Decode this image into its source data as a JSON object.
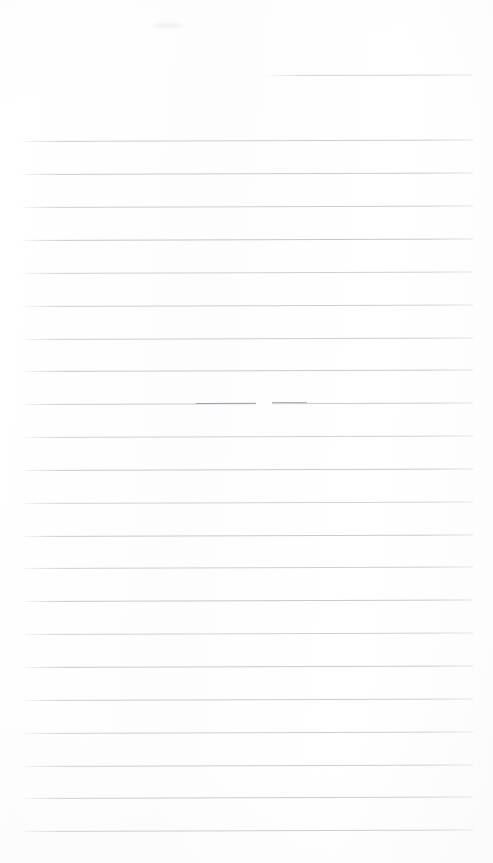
{
  "page": {
    "width": 493,
    "height": 863,
    "background_color": "#fefefe",
    "paper_tone": "#fdfdfe",
    "content_text": "",
    "is_blank": "true"
  },
  "ruling": {
    "line_color": "#c9cacf",
    "line_color_dark": "#9b9ca3",
    "line_count": 22,
    "spacing_px": 33,
    "margin_left_px": 19,
    "margin_right_px": 473,
    "stroke_width_px": 1,
    "skew_degrees": -0.18
  },
  "lines": [
    {
      "name": "rule-01",
      "y": 75,
      "x1": 263,
      "x2": 472,
      "color": "#cdced3",
      "opacity": 0.85,
      "skew": -0.16
    },
    {
      "name": "rule-02",
      "y": 141,
      "x1": 19,
      "x2": 473,
      "color": "#c9cacf",
      "opacity": 0.9,
      "skew": -0.18
    },
    {
      "name": "rule-03",
      "y": 174,
      "x1": 19,
      "x2": 473,
      "color": "#c7c8ce",
      "opacity": 0.92,
      "skew": -0.18
    },
    {
      "name": "rule-04",
      "y": 207,
      "x1": 19,
      "x2": 473,
      "color": "#c9cacf",
      "opacity": 0.9,
      "skew": -0.18
    },
    {
      "name": "rule-05",
      "y": 240,
      "x1": 19,
      "x2": 473,
      "color": "#c4c5cb",
      "opacity": 0.94,
      "skew": -0.19
    },
    {
      "name": "rule-06",
      "y": 273,
      "x1": 19,
      "x2": 473,
      "color": "#cbccd1",
      "opacity": 0.88,
      "skew": -0.18
    },
    {
      "name": "rule-07",
      "y": 306,
      "x1": 19,
      "x2": 473,
      "color": "#cacbd0",
      "opacity": 0.9,
      "skew": -0.18
    },
    {
      "name": "rule-08",
      "y": 339,
      "x1": 19,
      "x2": 473,
      "color": "#c8c9cf",
      "opacity": 0.9,
      "skew": -0.18
    },
    {
      "name": "rule-09",
      "y": 371,
      "x1": 19,
      "x2": 473,
      "color": "#c6c7cd",
      "opacity": 0.92,
      "skew": -0.18
    },
    {
      "name": "rule-10",
      "y": 404,
      "x1": 19,
      "x2": 473,
      "color": "#c6c7cd",
      "opacity": 0.92,
      "skew": -0.18
    },
    {
      "name": "rule-11",
      "y": 437,
      "x1": 19,
      "x2": 473,
      "color": "#cbccd1",
      "opacity": 0.88,
      "skew": -0.18
    },
    {
      "name": "rule-12",
      "y": 470,
      "x1": 19,
      "x2": 473,
      "color": "#c5c6cc",
      "opacity": 0.93,
      "skew": -0.18
    },
    {
      "name": "rule-13",
      "y": 503,
      "x1": 19,
      "x2": 473,
      "color": "#cccdd2",
      "opacity": 0.87,
      "skew": -0.18
    },
    {
      "name": "rule-14",
      "y": 536,
      "x1": 19,
      "x2": 473,
      "color": "#c6c7cd",
      "opacity": 0.92,
      "skew": -0.18
    },
    {
      "name": "rule-15",
      "y": 568,
      "x1": 19,
      "x2": 473,
      "color": "#cacbd0",
      "opacity": 0.9,
      "skew": -0.18
    },
    {
      "name": "rule-16",
      "y": 601,
      "x1": 19,
      "x2": 473,
      "color": "#c5c6cc",
      "opacity": 0.93,
      "skew": -0.18
    },
    {
      "name": "rule-17",
      "y": 634,
      "x1": 19,
      "x2": 473,
      "color": "#cbccd1",
      "opacity": 0.88,
      "skew": -0.18
    },
    {
      "name": "rule-18",
      "y": 667,
      "x1": 19,
      "x2": 473,
      "color": "#c6c7cd",
      "opacity": 0.92,
      "skew": -0.18
    },
    {
      "name": "rule-19",
      "y": 700,
      "x1": 19,
      "x2": 473,
      "color": "#c9cacf",
      "opacity": 0.9,
      "skew": -0.18
    },
    {
      "name": "rule-20",
      "y": 733,
      "x1": 19,
      "x2": 473,
      "color": "#cacbd0",
      "opacity": 0.89,
      "skew": -0.18
    },
    {
      "name": "rule-21",
      "y": 766,
      "x1": 19,
      "x2": 473,
      "color": "#c8c9cf",
      "opacity": 0.9,
      "skew": -0.18
    },
    {
      "name": "rule-22",
      "y": 798,
      "x1": 19,
      "x2": 473,
      "color": "#c5c6cc",
      "opacity": 0.92,
      "skew": -0.18
    },
    {
      "name": "rule-23",
      "y": 831,
      "x1": 19,
      "x2": 473,
      "color": "#c4c5cb",
      "opacity": 0.93,
      "skew": -0.18
    }
  ],
  "marks": [
    {
      "name": "dark-stroke-left",
      "type": "ink-stroke",
      "y": 404,
      "x1": 196,
      "x2": 256,
      "color": "#9b9ca3",
      "opacity": 0.9
    },
    {
      "name": "dark-stroke-right",
      "type": "ink-stroke",
      "y": 403,
      "x1": 272,
      "x2": 307,
      "color": "#a4a5ac",
      "opacity": 0.85
    },
    {
      "name": "ink-gap",
      "type": "gap",
      "y": 404,
      "x1": 256,
      "x2": 272,
      "color": "#ffffff",
      "opacity": 1
    },
    {
      "name": "faint-smudge",
      "type": "smudge",
      "x": 154,
      "y": 23,
      "width": 28,
      "height": 5,
      "color": "#f2f2f4",
      "opacity": 0.9
    }
  ]
}
